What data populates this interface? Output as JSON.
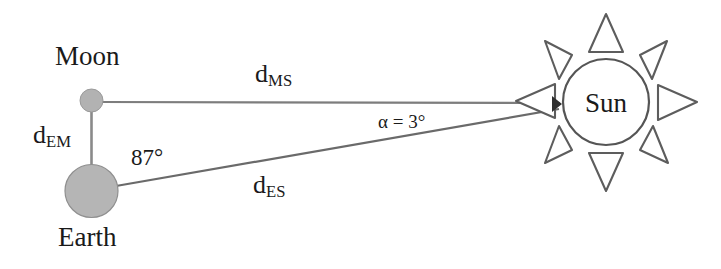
{
  "figure": {
    "background_color": "#ffffff",
    "line_color": "#6b6b6b",
    "body_fill": "#b5b5b5",
    "body_stroke": "#8a8a8a",
    "text_color": "#1a1a1a"
  },
  "bodies": {
    "moon": {
      "label": "Moon",
      "cx": 91.5,
      "cy": 100.5,
      "r": 11.5
    },
    "earth": {
      "label": "Earth",
      "cx": 91.5,
      "cy": 191,
      "r": 26.5
    },
    "sun": {
      "label": "Sun",
      "cx": 606,
      "cy": 102,
      "r": 43,
      "ray_count": 8
    }
  },
  "distances": {
    "moon_sun": {
      "symbol": "d",
      "subscript": "MS",
      "full": "d_MS"
    },
    "earth_moon": {
      "symbol": "d",
      "subscript": "EM",
      "full": "d_EM"
    },
    "earth_sun": {
      "symbol": "d",
      "subscript": "ES",
      "full": "d_ES"
    }
  },
  "angles": {
    "at_earth": {
      "value": "87°",
      "vertex": "earth"
    },
    "at_sun": {
      "symbol": "α",
      "equals": "=",
      "value": "3°",
      "text": "α = 3°",
      "vertex": "sun"
    }
  },
  "geometry": {
    "convergence_point": {
      "x": 558,
      "y": 107
    },
    "moon_line_y": 102,
    "earth_line_start": {
      "x": 116,
      "y": 186
    }
  }
}
